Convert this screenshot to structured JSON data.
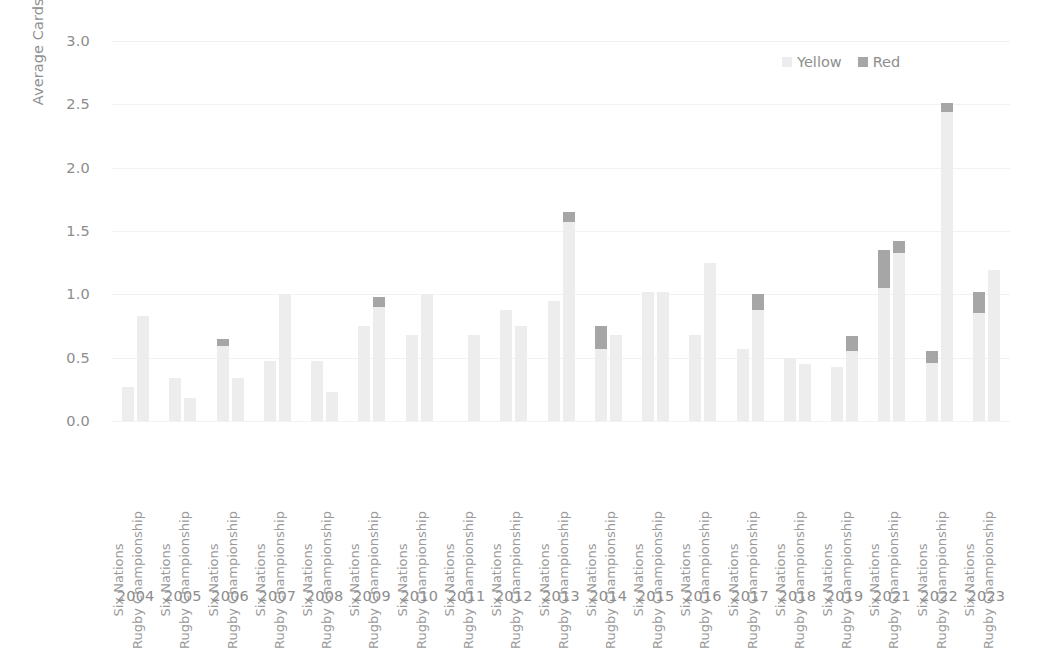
{
  "chart_data": {
    "type": "bar",
    "subtype": "stacked-grouped-bar",
    "title": "",
    "xlabel": "",
    "ylabel": "Average Cards per Game",
    "ylim": [
      0.0,
      3.0
    ],
    "ytick_labels": [
      "3.0",
      "2.5",
      "2.0",
      "1.5",
      "1.0",
      "0.5",
      "0.0"
    ],
    "ytick_values": [
      3.0,
      2.5,
      2.0,
      1.5,
      1.0,
      0.5,
      0.0
    ],
    "grid": true,
    "grid_axis": "y",
    "legend_position": "top-right",
    "legend": [
      {
        "name": "Yellow",
        "color": "#ededed"
      },
      {
        "name": "Red",
        "color": "#a6a6a6"
      }
    ],
    "categories": [
      "Six Nations",
      "Rugby Championship"
    ],
    "years": [
      "2004",
      "2005",
      "2006",
      "2007",
      "2008",
      "2009",
      "2010",
      "2011",
      "2012",
      "2013",
      "2014",
      "2015",
      "2016",
      "2017",
      "2018",
      "2019",
      "2021",
      "2022",
      "2023"
    ],
    "groups": [
      {
        "year": "2004",
        "bars": [
          {
            "competition": "Six Nations",
            "yellow": 0.27,
            "red": 0.0,
            "total": 0.27
          },
          {
            "competition": "Rugby Championship",
            "yellow": 0.83,
            "red": 0.0,
            "total": 0.83
          }
        ]
      },
      {
        "year": "2005",
        "bars": [
          {
            "competition": "Six Nations",
            "yellow": 0.34,
            "red": 0.0,
            "total": 0.34
          },
          {
            "competition": "Rugby Championship",
            "yellow": 0.18,
            "red": 0.0,
            "total": 0.18
          }
        ]
      },
      {
        "year": "2006",
        "bars": [
          {
            "competition": "Six Nations",
            "yellow": 0.59,
            "red": 0.06,
            "total": 0.65
          },
          {
            "competition": "Rugby Championship",
            "yellow": 0.34,
            "red": 0.0,
            "total": 0.34
          }
        ]
      },
      {
        "year": "2007",
        "bars": [
          {
            "competition": "Six Nations",
            "yellow": 0.47,
            "red": 0.0,
            "total": 0.47
          },
          {
            "competition": "Rugby Championship",
            "yellow": 1.0,
            "red": 0.0,
            "total": 1.0
          }
        ]
      },
      {
        "year": "2008",
        "bars": [
          {
            "competition": "Six Nations",
            "yellow": 0.47,
            "red": 0.0,
            "total": 0.47
          },
          {
            "competition": "Rugby Championship",
            "yellow": 0.23,
            "red": 0.0,
            "total": 0.23
          }
        ]
      },
      {
        "year": "2009",
        "bars": [
          {
            "competition": "Six Nations",
            "yellow": 0.75,
            "red": 0.0,
            "total": 0.75
          },
          {
            "competition": "Rugby Championship",
            "yellow": 0.9,
            "red": 0.08,
            "total": 0.98
          }
        ]
      },
      {
        "year": "2010",
        "bars": [
          {
            "competition": "Six Nations",
            "yellow": 0.68,
            "red": 0.0,
            "total": 0.68
          },
          {
            "competition": "Rugby Championship",
            "yellow": 1.0,
            "red": 0.0,
            "total": 1.0
          }
        ]
      },
      {
        "year": "2011",
        "bars": [
          {
            "competition": "Six Nations",
            "yellow": 0.0,
            "red": 0.0,
            "total": 0.0
          },
          {
            "competition": "Rugby Championship",
            "yellow": 0.68,
            "red": 0.0,
            "total": 0.68
          }
        ]
      },
      {
        "year": "2012",
        "bars": [
          {
            "competition": "Six Nations",
            "yellow": 0.88,
            "red": 0.0,
            "total": 0.88
          },
          {
            "competition": "Rugby Championship",
            "yellow": 0.75,
            "red": 0.0,
            "total": 0.75
          }
        ]
      },
      {
        "year": "2013",
        "bars": [
          {
            "competition": "Six Nations",
            "yellow": 0.95,
            "red": 0.0,
            "total": 0.95
          },
          {
            "competition": "Rugby Championship",
            "yellow": 1.57,
            "red": 0.08,
            "total": 1.65
          }
        ]
      },
      {
        "year": "2014",
        "bars": [
          {
            "competition": "Six Nations",
            "yellow": 0.57,
            "red": 0.18,
            "total": 0.75
          },
          {
            "competition": "Rugby Championship",
            "yellow": 0.68,
            "red": 0.0,
            "total": 0.68
          }
        ]
      },
      {
        "year": "2015",
        "bars": [
          {
            "competition": "Six Nations",
            "yellow": 1.02,
            "red": 0.0,
            "total": 1.02
          },
          {
            "competition": "Rugby Championship",
            "yellow": 1.02,
            "red": 0.0,
            "total": 1.02
          }
        ]
      },
      {
        "year": "2016",
        "bars": [
          {
            "competition": "Six Nations",
            "yellow": 0.68,
            "red": 0.0,
            "total": 0.68
          },
          {
            "competition": "Rugby Championship",
            "yellow": 1.25,
            "red": 0.0,
            "total": 1.25
          }
        ]
      },
      {
        "year": "2017",
        "bars": [
          {
            "competition": "Six Nations",
            "yellow": 0.57,
            "red": 0.0,
            "total": 0.57
          },
          {
            "competition": "Rugby Championship",
            "yellow": 0.88,
            "red": 0.12,
            "total": 1.0
          }
        ]
      },
      {
        "year": "2018",
        "bars": [
          {
            "competition": "Six Nations",
            "yellow": 0.5,
            "red": 0.0,
            "total": 0.5
          },
          {
            "competition": "Rugby Championship",
            "yellow": 0.45,
            "red": 0.0,
            "total": 0.45
          }
        ]
      },
      {
        "year": "2019",
        "bars": [
          {
            "competition": "Six Nations",
            "yellow": 0.43,
            "red": 0.0,
            "total": 0.43
          },
          {
            "competition": "Rugby Championship",
            "yellow": 0.55,
            "red": 0.12,
            "total": 0.67
          }
        ]
      },
      {
        "year": "2021",
        "bars": [
          {
            "competition": "Six Nations",
            "yellow": 1.05,
            "red": 0.3,
            "total": 1.35
          },
          {
            "competition": "Rugby Championship",
            "yellow": 1.33,
            "red": 0.09,
            "total": 1.42
          }
        ]
      },
      {
        "year": "2022",
        "bars": [
          {
            "competition": "Six Nations",
            "yellow": 0.46,
            "red": 0.09,
            "total": 0.55
          },
          {
            "competition": "Rugby Championship",
            "yellow": 2.44,
            "red": 0.07,
            "total": 2.51
          }
        ]
      },
      {
        "year": "2023",
        "bars": [
          {
            "competition": "Six Nations",
            "yellow": 0.85,
            "red": 0.17,
            "total": 1.02
          },
          {
            "competition": "Rugby Championship",
            "yellow": 1.19,
            "red": 0.0,
            "total": 1.19
          }
        ]
      }
    ]
  },
  "colors": {
    "yellow_series": "#ededed",
    "red_series": "#a6a6a6",
    "gridline": "#f2f2f2",
    "text": "#8d8d8d",
    "background": "#ffffff"
  }
}
